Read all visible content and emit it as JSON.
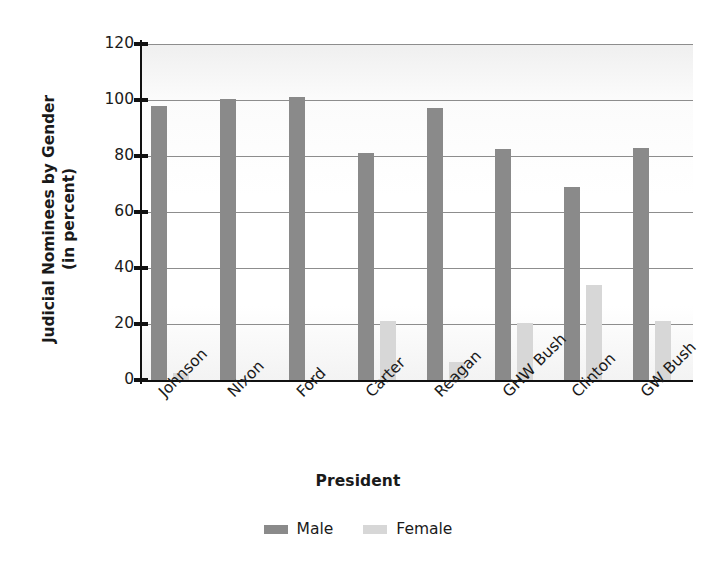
{
  "chart_data": {
    "type": "bar",
    "title": "",
    "xlabel": "President",
    "ylabel": "Judicial Nominees by Gender (in percent)",
    "ylabel_line1": "Judicial Nominees by Gender",
    "ylabel_line2": "(in percent)",
    "categories": [
      "Johnson",
      "Nixon",
      "Ford",
      "Carter",
      "Reagan",
      "GHW Bush",
      "Clinton",
      "GW Bush"
    ],
    "series": [
      {
        "name": "Male",
        "color": "#8a8a8a",
        "values": [
          98,
          100.5,
          101,
          81,
          97,
          82.5,
          69,
          83
        ]
      },
      {
        "name": "Female",
        "color": "#d7d7d7",
        "values": [
          2.5,
          0,
          0,
          21,
          6.5,
          20.5,
          34,
          21
        ]
      }
    ],
    "ylim": [
      0,
      120
    ],
    "yticks": [
      0,
      20,
      40,
      60,
      80,
      100,
      120
    ],
    "ytick_labels": [
      "0",
      "20",
      "40",
      "60",
      "80",
      "100",
      "120"
    ],
    "grid": true,
    "grid_axis": "y",
    "legend_position": "bottom-center"
  },
  "legend": {
    "entries": [
      {
        "label": "Male",
        "swatch": "male-swatch"
      },
      {
        "label": "Female",
        "swatch": "female-swatch"
      }
    ]
  }
}
